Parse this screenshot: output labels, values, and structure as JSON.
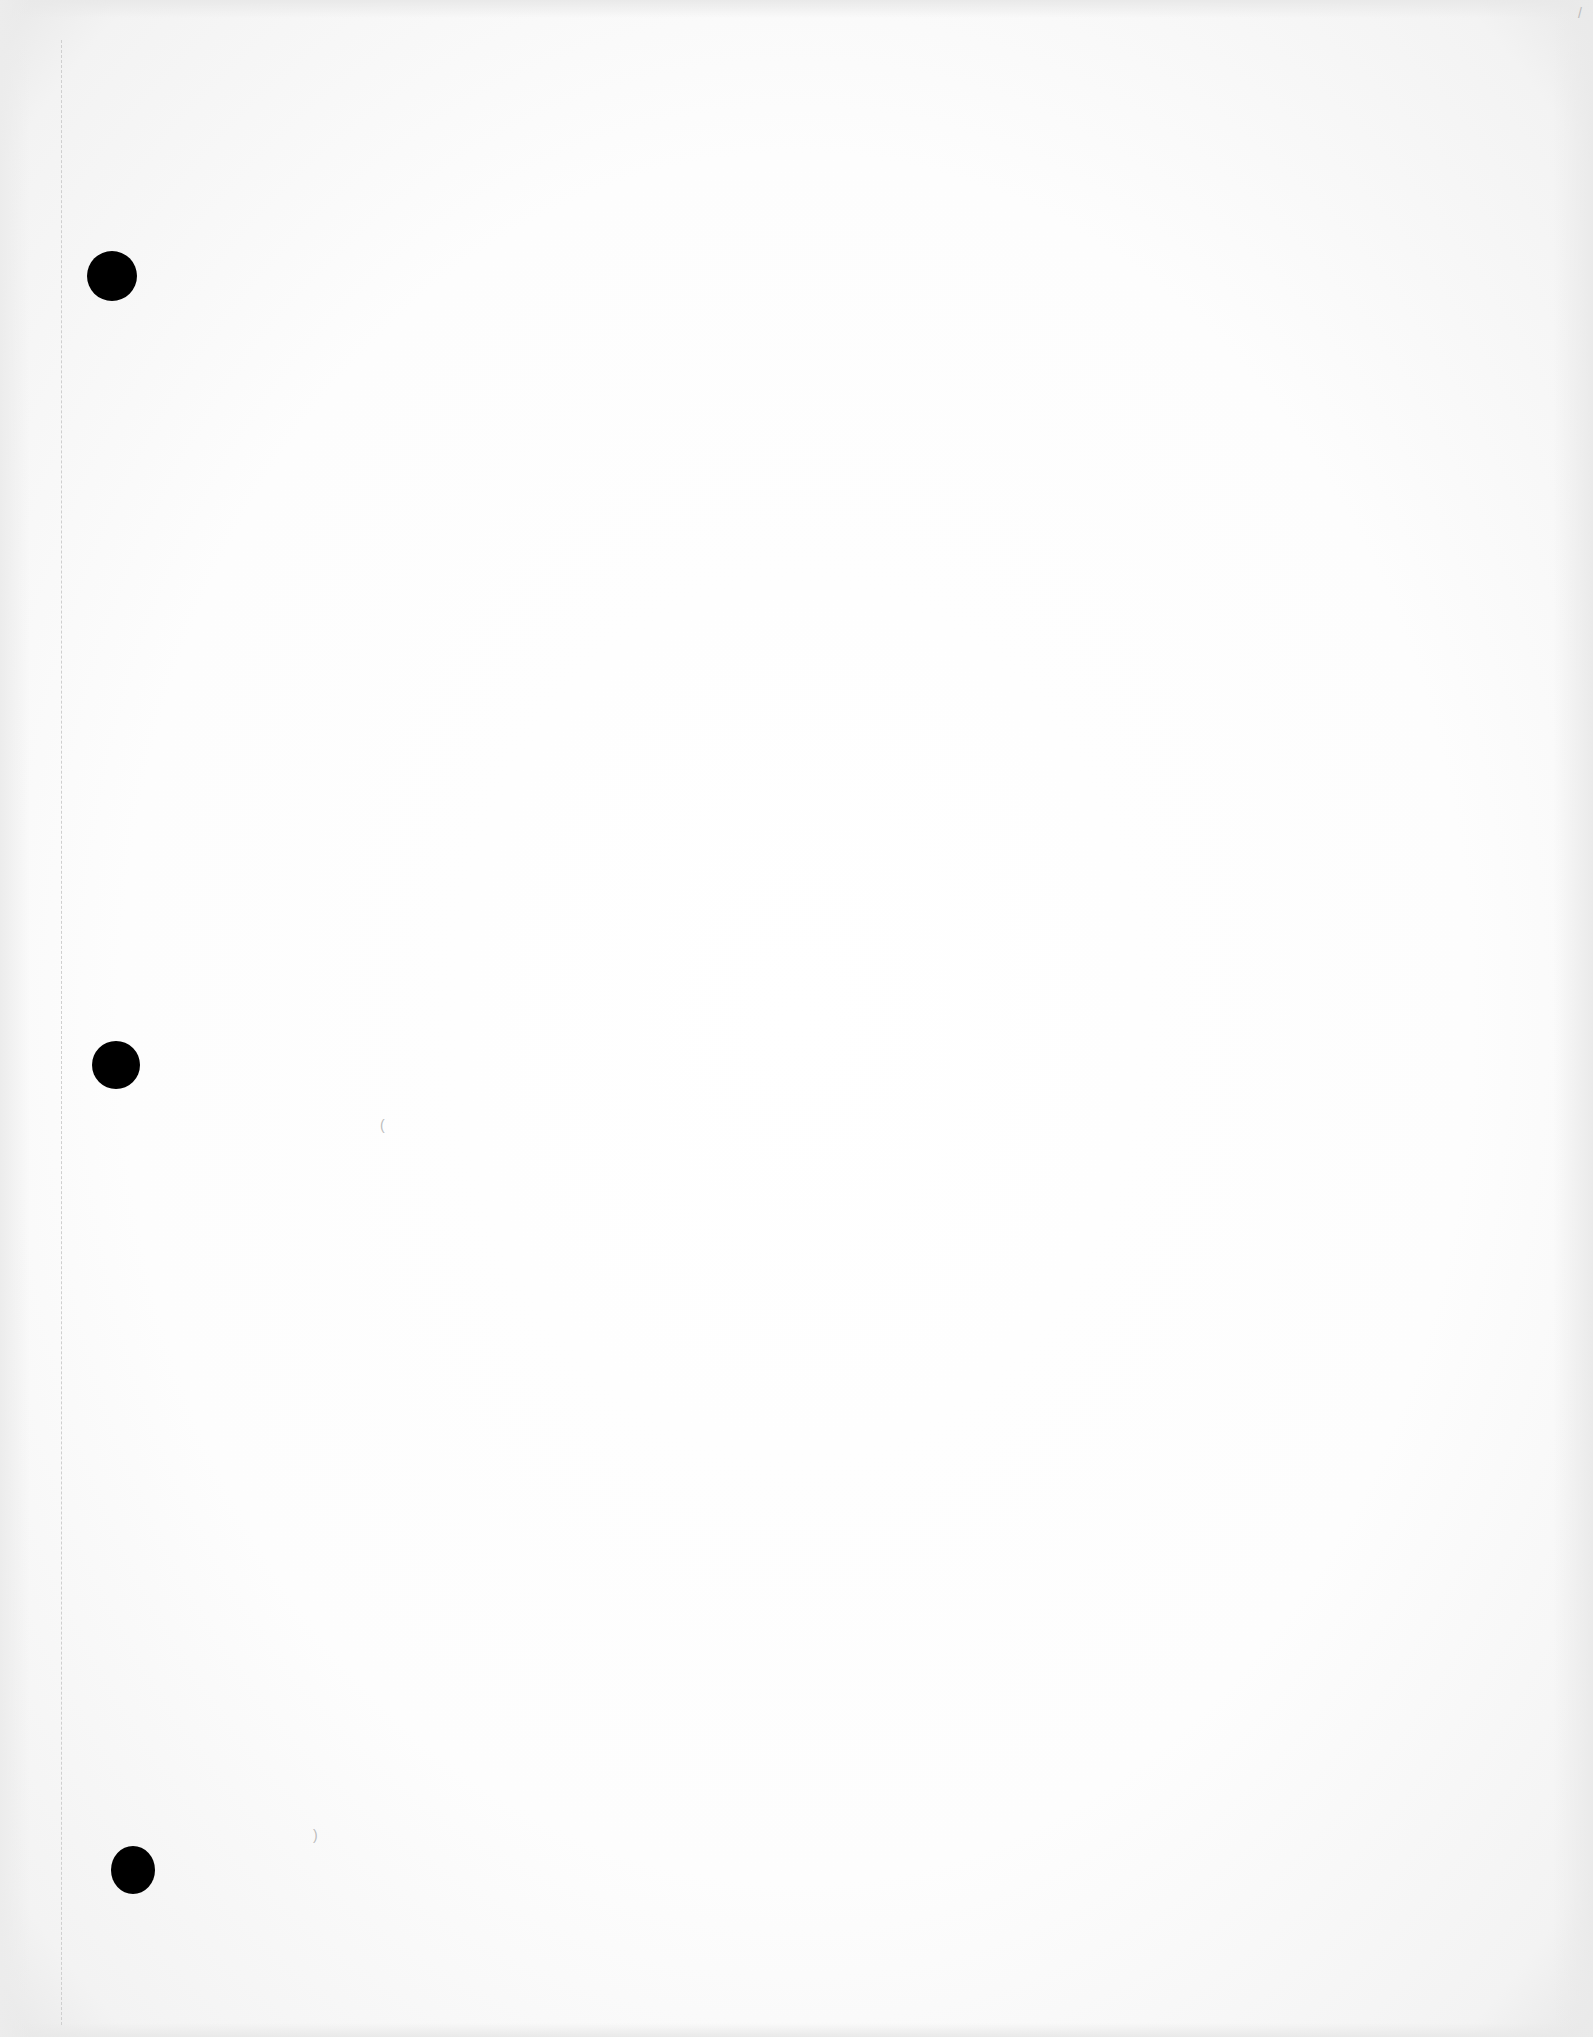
{
  "page": {
    "type": "blank-three-hole-punched-sheet",
    "background_color": "#ffffff",
    "hole_color": "#000000",
    "holes": [
      {
        "label": "top-hole",
        "x": 87,
        "y": 251,
        "w": 50,
        "h": 50
      },
      {
        "label": "middle-hole",
        "x": 92,
        "y": 1041,
        "w": 48,
        "h": 48
      },
      {
        "label": "bottom-hole",
        "x": 111,
        "y": 1846,
        "w": 44,
        "h": 48
      }
    ],
    "specks": [
      {
        "char": "(",
        "x": 380,
        "y": 1118
      },
      {
        "char": "/",
        "x": 1578,
        "y": 6
      },
      {
        "char": ")",
        "x": 313,
        "y": 1828
      }
    ]
  }
}
